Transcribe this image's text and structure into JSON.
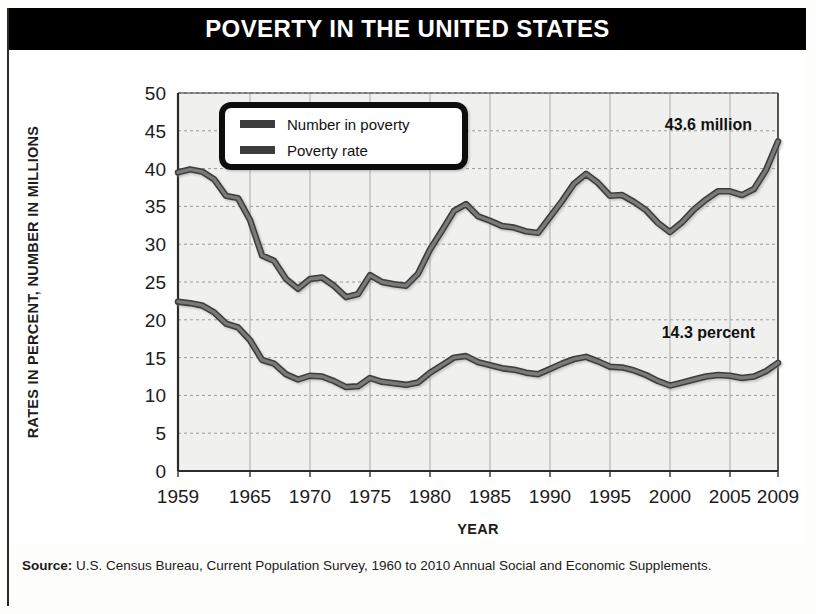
{
  "title": "POVERTY IN THE UNITED STATES",
  "source": {
    "label": "Source:",
    "text": " U.S. Census Bureau, Current Population Survey, 1960 to 2010 Annual Social and Economic Supplements."
  },
  "colors": {
    "banner_background": "#000000",
    "banner_text": "#ffffff",
    "line": "#6b6b6b",
    "line_edge": "#3c3c3c",
    "plot_background": "#f0f0ee",
    "grid": "#9a9a9a",
    "axis": "#2b2b2b"
  },
  "legend": {
    "position": "top-left-inside",
    "items": [
      {
        "label": "Number in poverty",
        "swatch": "line-swatch-number"
      },
      {
        "label": "Poverty rate",
        "swatch": "line-swatch-rate"
      }
    ]
  },
  "annotations": [
    {
      "text": "43.6 million",
      "x": 2003.2,
      "y": 45.1
    },
    {
      "text": "14.3 percent",
      "x": 2003.2,
      "y": 17.6
    }
  ],
  "chart_data": {
    "type": "line",
    "title": "POVERTY IN THE UNITED STATES",
    "xlabel": "YEAR",
    "ylabel": "RATES IN PERCENT, NUMBER IN MILLIONS",
    "xlim": [
      1959,
      2009
    ],
    "ylim": [
      0,
      50
    ],
    "yticks": [
      0,
      5,
      10,
      15,
      20,
      25,
      30,
      35,
      40,
      45,
      50
    ],
    "xticks": [
      1959,
      1965,
      1970,
      1975,
      1980,
      1985,
      1990,
      1995,
      2000,
      2005,
      2009
    ],
    "xtick_labels": [
      "1959",
      "1965",
      "1970",
      "1975",
      "1980",
      "1985",
      "1990",
      "1995",
      "2000",
      "2005",
      "2009"
    ],
    "grid": true,
    "legend_position": "upper left",
    "x": [
      1959,
      1960,
      1961,
      1962,
      1963,
      1964,
      1965,
      1966,
      1967,
      1968,
      1969,
      1970,
      1971,
      1972,
      1973,
      1974,
      1975,
      1976,
      1977,
      1978,
      1979,
      1980,
      1981,
      1982,
      1983,
      1984,
      1985,
      1986,
      1987,
      1988,
      1989,
      1990,
      1991,
      1992,
      1993,
      1994,
      1995,
      1996,
      1997,
      1998,
      1999,
      2000,
      2001,
      2002,
      2003,
      2004,
      2005,
      2006,
      2007,
      2008,
      2009
    ],
    "series": [
      {
        "name": "Number in poverty",
        "units": "millions",
        "values": [
          39.5,
          39.9,
          39.6,
          38.6,
          36.4,
          36.1,
          33.2,
          28.5,
          27.8,
          25.4,
          24.1,
          25.4,
          25.6,
          24.5,
          23.0,
          23.4,
          25.9,
          25.0,
          24.7,
          24.5,
          26.1,
          29.3,
          31.8,
          34.4,
          35.3,
          33.7,
          33.1,
          32.4,
          32.2,
          31.7,
          31.5,
          33.6,
          35.7,
          38.0,
          39.3,
          38.1,
          36.4,
          36.5,
          35.6,
          34.5,
          32.8,
          31.6,
          32.9,
          34.6,
          35.9,
          37.0,
          37.0,
          36.5,
          37.3,
          39.8,
          43.6
        ],
        "end_label": "43.6 million"
      },
      {
        "name": "Poverty rate",
        "units": "percent",
        "values": [
          22.4,
          22.2,
          21.9,
          21.0,
          19.5,
          19.0,
          17.3,
          14.7,
          14.2,
          12.8,
          12.1,
          12.6,
          12.5,
          11.9,
          11.1,
          11.2,
          12.3,
          11.8,
          11.6,
          11.4,
          11.7,
          13.0,
          14.0,
          15.0,
          15.2,
          14.4,
          14.0,
          13.6,
          13.4,
          13.0,
          12.8,
          13.5,
          14.2,
          14.8,
          15.1,
          14.5,
          13.8,
          13.7,
          13.3,
          12.7,
          11.9,
          11.3,
          11.7,
          12.1,
          12.5,
          12.7,
          12.6,
          12.3,
          12.5,
          13.2,
          14.3
        ],
        "end_label": "14.3 percent"
      }
    ]
  }
}
